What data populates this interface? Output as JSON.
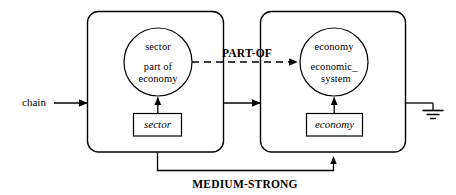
{
  "diagram": {
    "type": "semantic-network-frame-diagram",
    "background_color": "#ffffff",
    "line_color": "#000000",
    "boxes": [
      {
        "id": "left-frame",
        "concept_line1": "sector",
        "concept_line2": "part of",
        "concept_line3": "economy",
        "instance_label": "sector"
      },
      {
        "id": "right-frame",
        "concept_line1": "economy",
        "concept_line2": "economic_",
        "concept_line3": "system",
        "instance_label": "economy"
      }
    ],
    "edges": {
      "input_label": "chain",
      "part_of_label": "PART-OF",
      "strength_label": "MEDIUM-STRONG"
    },
    "ground_symbol": "ground-icon"
  }
}
